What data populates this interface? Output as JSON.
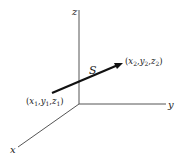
{
  "diagram": {
    "axes": {
      "x_label": "x",
      "y_label": "y",
      "z_label": "z"
    },
    "vector": {
      "label": "S",
      "start_point": {
        "x": "x",
        "xs": "1",
        "y": "y",
        "ys": "1",
        "z": "z",
        "zs": "1"
      },
      "end_point": {
        "x": "x",
        "xs": "2",
        "y": "y",
        "ys": "2",
        "z": "z",
        "zs": "2"
      }
    },
    "colors": {
      "axis": "#555555",
      "vector": "#111111",
      "text": "#222222"
    }
  }
}
